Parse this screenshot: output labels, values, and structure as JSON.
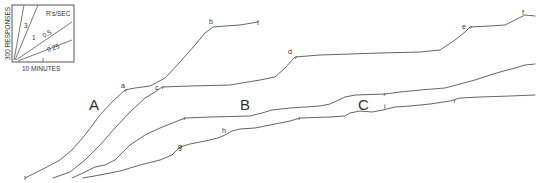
{
  "figure": {
    "type": "cumulative_record",
    "inset": {
      "y_label": "300 RESPONSES",
      "x_label": "10 MINUTES",
      "rate_title": "R's/SEC",
      "rate_labels": [
        "3",
        "1",
        "0.5",
        "0.25"
      ]
    },
    "panel_labels": [
      "A",
      "B",
      "C"
    ],
    "point_labels": [
      "a",
      "b",
      "c",
      "d",
      "e",
      "f",
      "g",
      "h",
      "i"
    ]
  },
  "chart_data": {
    "type": "line",
    "title": "",
    "xlabel": "10 MINUTES (scale bar)",
    "ylabel": "300 RESPONSES (scale bar)",
    "grid": false,
    "legend": "inset rate fan: 3, 1, 0.5, 0.25 R's/SEC",
    "series": [
      {
        "name": "A (record 1)",
        "points_px": [
          [
            25,
            178
          ],
          [
            45,
            168
          ],
          [
            60,
            160
          ],
          [
            72,
            150
          ],
          [
            85,
            135
          ],
          [
            100,
            115
          ],
          [
            112,
            102
          ],
          [
            125,
            90
          ],
          [
            135,
            88
          ],
          [
            150,
            86
          ],
          [
            165,
            78
          ],
          [
            180,
            62
          ],
          [
            195,
            45
          ],
          [
            205,
            33
          ],
          [
            213,
            27
          ],
          [
            225,
            26
          ],
          [
            240,
            25
          ],
          [
            252,
            23
          ],
          [
            258,
            22
          ]
        ],
        "annotations": [
          {
            "label": "a",
            "at": [
              125,
              90
            ]
          },
          {
            "label": "b",
            "at": [
              213,
              27
            ]
          }
        ]
      },
      {
        "name": "A (record 2)",
        "points_px": [
          [
            53,
            178
          ],
          [
            70,
            172
          ],
          [
            85,
            160
          ],
          [
            100,
            145
          ],
          [
            115,
            128
          ],
          [
            130,
            112
          ],
          [
            145,
            98
          ],
          [
            155,
            92
          ],
          [
            162,
            87
          ],
          [
            190,
            86
          ],
          [
            230,
            85
          ],
          [
            260,
            80
          ],
          [
            275,
            77
          ],
          [
            285,
            68
          ],
          [
            295,
            57
          ],
          [
            320,
            55
          ],
          [
            380,
            53
          ],
          [
            420,
            52
          ],
          [
            440,
            50
          ],
          [
            455,
            40
          ],
          [
            465,
            32
          ],
          [
            470,
            27
          ],
          [
            490,
            26
          ],
          [
            505,
            25
          ],
          [
            515,
            20
          ],
          [
            525,
            15
          ],
          [
            535,
            16
          ]
        ],
        "annotations": [
          {
            "label": "c",
            "at": [
              162,
              87
            ]
          },
          {
            "label": "d",
            "at": [
              295,
              57
            ]
          },
          {
            "label": "e",
            "at": [
              470,
              27
            ]
          },
          {
            "label": "f",
            "at": [
              525,
              15
            ]
          }
        ]
      },
      {
        "name": "B",
        "points_px": [
          [
            72,
            178
          ],
          [
            85,
            172
          ],
          [
            95,
            167
          ],
          [
            105,
            165
          ],
          [
            115,
            160
          ],
          [
            130,
            145
          ],
          [
            145,
            135
          ],
          [
            160,
            128
          ],
          [
            175,
            122
          ],
          [
            185,
            118
          ],
          [
            210,
            117
          ],
          [
            250,
            116
          ],
          [
            262,
            113
          ],
          [
            272,
            110
          ],
          [
            290,
            108
          ],
          [
            320,
            106
          ],
          [
            330,
            104
          ],
          [
            345,
            97
          ],
          [
            355,
            95
          ],
          [
            385,
            94
          ],
          [
            400,
            92
          ],
          [
            420,
            90
          ],
          [
            445,
            88
          ],
          [
            460,
            84
          ],
          [
            475,
            80
          ],
          [
            490,
            75
          ],
          [
            500,
            72
          ],
          [
            515,
            68
          ],
          [
            525,
            65
          ],
          [
            535,
            64
          ]
        ],
        "annotations": []
      },
      {
        "name": "C",
        "points_px": [
          [
            83,
            178
          ],
          [
            100,
            175
          ],
          [
            120,
            171
          ],
          [
            140,
            165
          ],
          [
            160,
            160
          ],
          [
            172,
            155
          ],
          [
            180,
            147
          ],
          [
            190,
            144
          ],
          [
            205,
            141
          ],
          [
            218,
            138
          ],
          [
            225,
            135
          ],
          [
            232,
            131
          ],
          [
            240,
            129
          ],
          [
            255,
            128
          ],
          [
            275,
            124
          ],
          [
            290,
            121
          ],
          [
            300,
            118
          ],
          [
            330,
            117
          ],
          [
            345,
            116
          ],
          [
            350,
            113
          ],
          [
            360,
            111
          ],
          [
            372,
            112
          ],
          [
            383,
            110
          ],
          [
            395,
            107
          ],
          [
            410,
            106
          ],
          [
            430,
            104
          ],
          [
            450,
            101
          ],
          [
            460,
            98
          ],
          [
            480,
            97
          ],
          [
            510,
            96
          ],
          [
            535,
            95
          ]
        ],
        "annotations": [
          {
            "label": "g",
            "at": [
              180,
              147
            ]
          },
          {
            "label": "h",
            "at": [
              225,
              135
            ]
          },
          {
            "label": "i",
            "at": [
              383,
              110
            ]
          }
        ]
      }
    ]
  }
}
